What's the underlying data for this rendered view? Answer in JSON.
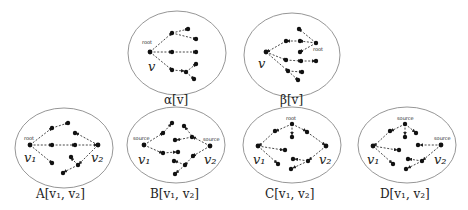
{
  "figure": {
    "panels": [
      {
        "id": "alpha",
        "caption": "α[v]",
        "vertex_labels": [
          "v"
        ],
        "node_labels": [
          "root"
        ]
      },
      {
        "id": "beta",
        "caption": "β[v]",
        "vertex_labels": [
          "v"
        ],
        "node_labels": [
          "root"
        ]
      },
      {
        "id": "A",
        "caption": "A[v₁, v₂]",
        "vertex_labels": [
          "v₁",
          "v₂"
        ],
        "node_labels": [
          "root"
        ]
      },
      {
        "id": "B",
        "caption": "B[v₁, v₂]",
        "vertex_labels": [
          "v₁",
          "v₂"
        ],
        "node_labels": [
          "source",
          "source"
        ]
      },
      {
        "id": "C",
        "caption": "C[v₁, v₂]",
        "vertex_labels": [
          "v₁",
          "v₂"
        ],
        "node_labels": [
          "root"
        ]
      },
      {
        "id": "D",
        "caption": "D[v₁, v₂]",
        "vertex_labels": [
          "v₁",
          "v₂"
        ],
        "node_labels": [
          "source",
          "source"
        ]
      }
    ]
  },
  "colors": {
    "ellipse": "#8a8a8a",
    "node": "#111111",
    "edge": "#333333"
  }
}
